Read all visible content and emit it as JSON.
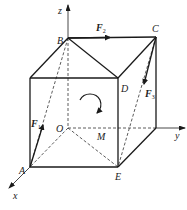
{
  "diagram": {
    "type": "3d-cube-force-system",
    "axes": {
      "x": "x",
      "y": "y",
      "z": "z"
    },
    "points": {
      "A": "A",
      "B": "B",
      "C": "C",
      "D": "D",
      "E": "E",
      "O": "O",
      "M": "M"
    },
    "forces": [
      {
        "id": "F1",
        "symbol": "F",
        "subscript": "1"
      },
      {
        "id": "F2",
        "symbol": "F",
        "subscript": "2"
      },
      {
        "id": "F3",
        "symbol": "F",
        "subscript": "3"
      }
    ],
    "moment": "rotation-arrow-clockwise",
    "colors": {
      "line": "#1a1a1a",
      "background": "#ffffff"
    }
  }
}
